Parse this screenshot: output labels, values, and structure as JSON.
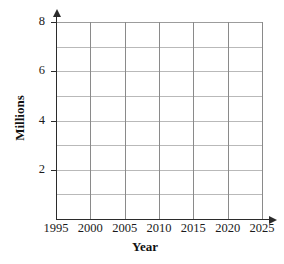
{
  "chart_data": {
    "type": "line",
    "title": "",
    "subtitle": "",
    "xlabel": "Year",
    "ylabel": "Millions",
    "xlim": [
      1995,
      2025
    ],
    "ylim": [
      0,
      8
    ],
    "x_tick_labels": [
      "1995",
      "2000",
      "2005",
      "2010",
      "2015",
      "2020",
      "2025"
    ],
    "x_tick_values": [
      1995,
      2000,
      2005,
      2010,
      2015,
      2020,
      2025
    ],
    "y_tick_labels": [
      "2",
      "4",
      "6",
      "8"
    ],
    "y_tick_values": [
      2,
      4,
      6,
      8
    ],
    "y_gridline_values": [
      1,
      2,
      3,
      4,
      5,
      6,
      7,
      8
    ],
    "grid": "both",
    "legend": "none",
    "series": [],
    "values": [],
    "categories": [],
    "annotations": [],
    "note": "Empty coordinate grid — no data points plotted"
  },
  "axes": {
    "x": {
      "label": "Year",
      "ticks": [
        {
          "label": "1995",
          "value": 1995
        },
        {
          "label": "2000",
          "value": 2000
        },
        {
          "label": "2005",
          "value": 2005
        },
        {
          "label": "2010",
          "value": 2010
        },
        {
          "label": "2015",
          "value": 2015
        },
        {
          "label": "2020",
          "value": 2020
        },
        {
          "label": "2025",
          "value": 2025
        }
      ]
    },
    "y": {
      "label": "Millions",
      "ticks": [
        {
          "label": "2",
          "value": 2
        },
        {
          "label": "4",
          "value": 4
        },
        {
          "label": "6",
          "value": 6
        },
        {
          "label": "8",
          "value": 8
        }
      ]
    }
  },
  "style": {
    "background": "#ffffff",
    "axis_color": "#2b2b2b",
    "gridline_vertical_color": "#8a8a8a",
    "gridline_horizontal_color": "#b9b9b9",
    "text_color": "#1a1a1a"
  }
}
